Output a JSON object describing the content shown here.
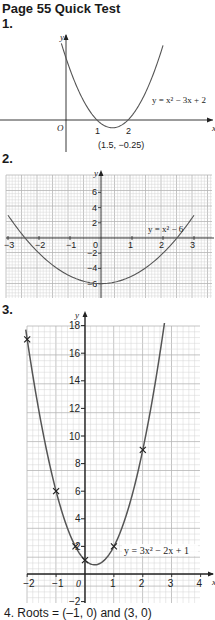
{
  "page": {
    "title": "Page 55 Quick Test",
    "q1_label": "1.",
    "q2_label": "2.",
    "q3_label": "3.",
    "footer": "4.   Roots = (–1, 0) and (3, 0)"
  },
  "colors": {
    "curve": "#555555",
    "axis": "#222222",
    "grid_minor": "#d4d4d4",
    "grid_major": "#b5b5b5"
  },
  "chart_data": [
    {
      "type": "line",
      "title": "y = x² − 3x + 2",
      "xlabel": "x",
      "ylabel": "y",
      "grid": false,
      "x_ticks": [
        "1",
        "2"
      ],
      "origin_label": "O",
      "annotations": [
        {
          "text": "(1.5, −0.25)",
          "x": 1.5,
          "y": -0.25
        }
      ],
      "curve_label": "y = x² − 3x + 2",
      "equation": {
        "a": 1,
        "b": -3,
        "c": 2
      },
      "x": [
        -0.15,
        0,
        0.5,
        1,
        1.5,
        2,
        2.5,
        3,
        3.15
      ],
      "y": [
        2.47,
        2,
        0.75,
        0,
        -0.25,
        0,
        0.75,
        2,
        2.47
      ]
    },
    {
      "type": "line",
      "title": "y = x² − 6",
      "xlabel": "",
      "ylabel": "y",
      "grid": true,
      "xlim": [
        -3,
        3
      ],
      "ylim": [
        -7,
        8
      ],
      "x_ticks": [
        "−3",
        "−2",
        "−1",
        "0",
        "1",
        "2",
        "3"
      ],
      "y_ticks": [
        "6",
        "4",
        "2",
        "−2",
        "−4",
        "−6"
      ],
      "curve_label": "y = x² − 6",
      "equation": {
        "a": 1,
        "b": 0,
        "c": -6
      },
      "x": [
        -3,
        -2,
        -1,
        0,
        1,
        2,
        3
      ],
      "y": [
        3,
        -2,
        -5,
        -6,
        -5,
        -2,
        3
      ]
    },
    {
      "type": "line",
      "title": "y = 3x² − 2x + 1",
      "xlabel": "x",
      "ylabel": "y",
      "grid": true,
      "xlim": [
        -2,
        4
      ],
      "ylim": [
        -2,
        18
      ],
      "x_ticks": [
        "−2",
        "−1",
        "0",
        "1",
        "2",
        "3",
        "4"
      ],
      "y_ticks": [
        "18",
        "16",
        "14",
        "12",
        "10",
        "8",
        "6",
        "4",
        "2",
        "−2"
      ],
      "curve_label": "y = 3x² − 2x + 1",
      "equation": {
        "a": 3,
        "b": -2,
        "c": 1
      },
      "points_marked": [
        {
          "x": -2,
          "y": 17
        },
        {
          "x": -1,
          "y": 6
        },
        {
          "x": 0,
          "y": 1
        },
        {
          "x": 1,
          "y": 2
        },
        {
          "x": 2,
          "y": 9
        },
        {
          "x": -0.33,
          "y": 2
        }
      ],
      "x": [
        -2,
        -1,
        0,
        1,
        2
      ],
      "y": [
        17,
        6,
        1,
        2,
        9
      ]
    }
  ]
}
